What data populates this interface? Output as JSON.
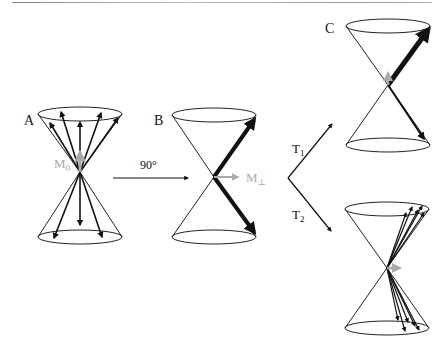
{
  "figure": {
    "panels": [
      {
        "id": "A",
        "label": "A",
        "magnetization_label": "M",
        "magnetization_sub": "0"
      },
      {
        "id": "B",
        "label": "B",
        "magnetization_label": "M",
        "magnetization_sub": "⊥"
      },
      {
        "id": "C",
        "label": "C"
      }
    ],
    "transitions": {
      "pulse_label": "90°",
      "t1_label": "T",
      "t1_sub": "1",
      "t2_label": "T",
      "t2_sub": "2"
    },
    "colors": {
      "line": "#111111",
      "magnetization": "#aaaaaa",
      "cone": "#222222"
    }
  }
}
